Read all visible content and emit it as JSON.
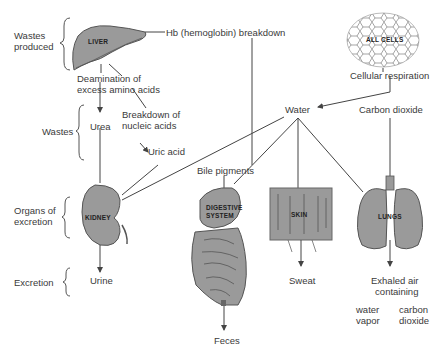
{
  "diagram": {
    "row_labels": {
      "wastes_produced": [
        "Wastes",
        "produced"
      ],
      "wastes": "Wastes",
      "organs_of_excretion": [
        "Organs of",
        "excretion"
      ],
      "excretion": "Excretion"
    },
    "nodes": {
      "liver": "LIVER",
      "all_cells": "ALL CELLS",
      "hb_breakdown": "Hb (hemoglobin) breakdown",
      "cellular_respiration": "Cellular respiration",
      "deamination": [
        "Deamination of",
        "excess amino acids"
      ],
      "breakdown_nucleic": [
        "Breakdown of",
        "nucleic acids"
      ],
      "water": "Water",
      "carbon_dioxide": "Carbon dioxide",
      "urea": "Urea",
      "uric_acid": "Uric acid",
      "bile_pigments": "Bile pigments",
      "kidney": "KIDNEY",
      "digestive_system": [
        "DIGESTIVE",
        "SYSTEM"
      ],
      "skin": "SKIN",
      "lungs": "LUNGS",
      "urine": "Urine",
      "feces": "Feces",
      "sweat": "Sweat",
      "exhaled_air": [
        "Exhaled air",
        "containing"
      ],
      "water_vapor": [
        "water",
        "vapor"
      ],
      "carbon_dioxide_exhaled": [
        "carbon",
        "dioxide"
      ]
    },
    "colors": {
      "organ_fill": "#9a9a9a",
      "organ_stroke": "#555555",
      "line": "#444444",
      "text": "#3a3a3a"
    }
  }
}
